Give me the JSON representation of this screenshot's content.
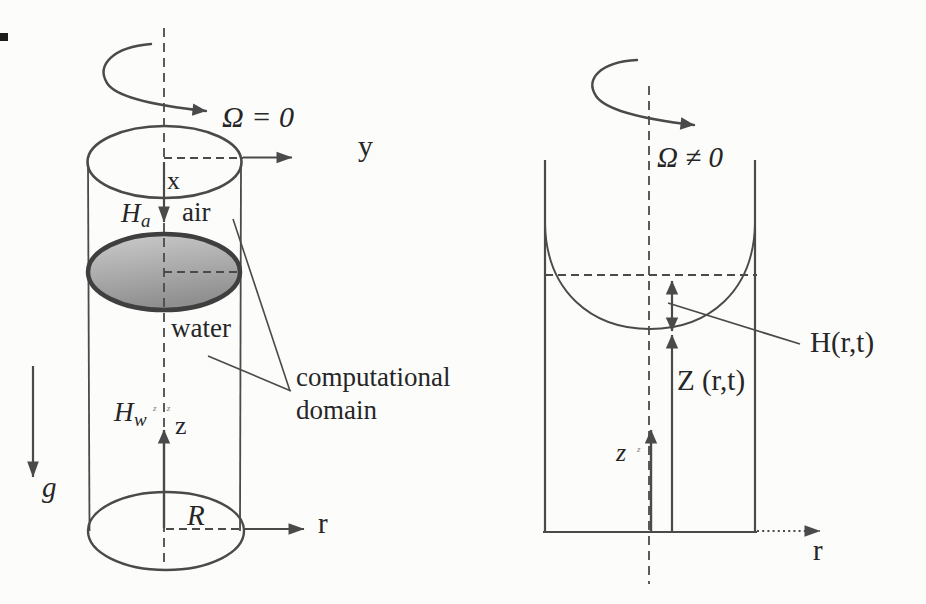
{
  "diagram": {
    "title_meaning": "Cylindrical tank: non-rotating (left) and rotating (right) free-surface configuration",
    "left": {
      "omega": "Ω = 0",
      "y_axis": "y",
      "x_axis": "x",
      "air_height": {
        "base": "H",
        "sub": "a"
      },
      "air": "air",
      "water": "water",
      "domain_label_line1": "computational",
      "domain_label_line2": "domain",
      "water_height": {
        "base": "H",
        "sub": "w"
      },
      "water_height_marks": "z z",
      "z_axis": "z",
      "gravity": "g",
      "radius": "R",
      "r_axis": "r"
    },
    "right": {
      "omega": "Ω ≠ 0",
      "surface_elevation": "H(r,t)",
      "interface_position": "Z (r,t)",
      "z_axis": "z",
      "z_axis_mark": "z",
      "r_axis": "r"
    },
    "colors": {
      "ink": "#4a4a4a",
      "text": "#262626",
      "water_light": "#cccccc",
      "water_dark": "#8f8f8f",
      "background": "#fcfcfb"
    }
  }
}
